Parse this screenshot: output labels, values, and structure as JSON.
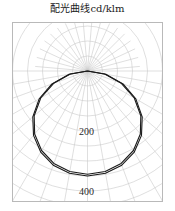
{
  "chart": {
    "title": "配光曲线cd/klm",
    "frame": {
      "x": 12,
      "y": 22,
      "width": 150,
      "height": 179,
      "border_color": "#b9b9b9"
    },
    "origin": {
      "x": 87.5,
      "y": 71
    },
    "grid_color": "#c9c9c9",
    "curve_color": "#1a1a1a"
  },
  "labels": {
    "radial_200": "200",
    "radial_400": "400"
  },
  "chart_data": {
    "type": "line",
    "subtype": "polar-photometric",
    "title": "配光曲线cd/klm",
    "xlabel": "",
    "ylabel": "cd/klm",
    "units": "cd/klm",
    "legend_position": "none",
    "grid": true,
    "polar": {
      "origin_direction": "down",
      "angle_start_deg": -90,
      "angle_end_deg": 90,
      "spoke_step_deg": 10,
      "radial_ticks": [
        100,
        200,
        300,
        400
      ],
      "labeled_radial_ticks": [
        200,
        400
      ],
      "rlim": [
        0,
        500
      ],
      "px_per_unit": 0.3
    },
    "series": [
      {
        "name": "C0-C180",
        "angles_deg": [
          -90,
          -80,
          -70,
          -60,
          -50,
          -40,
          -30,
          -20,
          -10,
          0,
          10,
          20,
          30,
          40,
          50,
          60,
          70,
          80,
          90
        ],
        "values": [
          0,
          62,
          126,
          186,
          238,
          280,
          312,
          334,
          346,
          350,
          346,
          334,
          312,
          280,
          238,
          186,
          126,
          62,
          0
        ]
      },
      {
        "name": "C90-C270",
        "angles_deg": [
          -90,
          -80,
          -70,
          -60,
          -50,
          -40,
          -30,
          -20,
          -10,
          0,
          10,
          20,
          30,
          40,
          50,
          60,
          70,
          80,
          90
        ],
        "values": [
          0,
          58,
          120,
          180,
          232,
          274,
          306,
          328,
          340,
          344,
          340,
          328,
          306,
          274,
          232,
          180,
          120,
          58,
          0
        ]
      }
    ]
  }
}
